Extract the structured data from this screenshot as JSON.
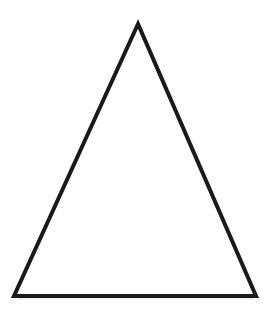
{
  "canvas": {
    "width": 272,
    "height": 321,
    "background_color": "#ffffff",
    "title": "Triangle Outline"
  },
  "shape": {
    "name": "triangle",
    "kind": "isosceles-triangle",
    "fill_color": "#ffffff",
    "stroke_color": "#1a1a1a",
    "stroke_width": 4,
    "stroke_linejoin": "miter",
    "vertices": [
      {
        "label": "apex",
        "x": 138,
        "y": 24
      },
      {
        "label": "bottom-left",
        "x": 14,
        "y": 296
      },
      {
        "label": "bottom-right",
        "x": 256,
        "y": 296
      }
    ],
    "points_attr": "138,24 14,296 256,296",
    "base_width": 242,
    "height": 272
  },
  "artifacts": {
    "baseline_shadow": "faint gray smudge below base edge"
  }
}
